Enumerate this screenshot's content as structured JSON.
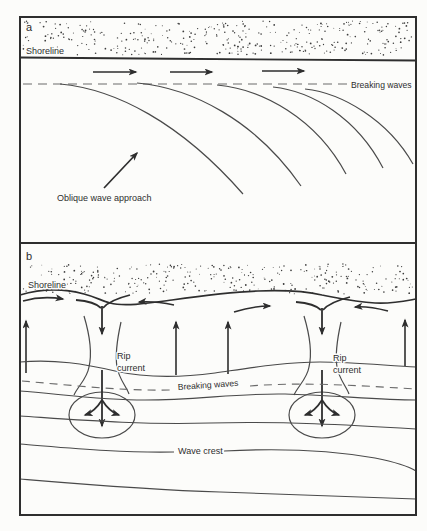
{
  "figure": {
    "colors": {
      "ink": "#2e2e2e",
      "curve": "#4a4a4a",
      "dashed_line": "#6b6b6b",
      "paper": "#fcfcfa"
    },
    "panel_a": {
      "tag": "a",
      "shoreline_label": "Shoreline",
      "breaking_waves_label": "Breaking waves",
      "oblique_wave_label": "Oblique wave approach"
    },
    "panel_b": {
      "tag": "b",
      "shoreline_label": "Shoreline",
      "breaking_waves_label": "Breaking waves",
      "rip_current_label_line1": "Rip",
      "rip_current_label_line2": "current",
      "wave_crest_label": "Wave crest"
    }
  }
}
